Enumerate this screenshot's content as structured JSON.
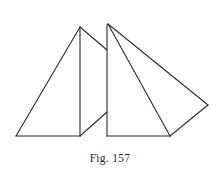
{
  "figure": {
    "caption": "Fig. 157",
    "background_color": "#ffffff",
    "stroke_color": "#2b2b2b",
    "stroke_width": 1.1,
    "caption_color": "#2b2b2b",
    "shape_description": "two overlapping triangles with shared interior segments",
    "vertices": {
      "left_apex": [
        80,
        27
      ],
      "left_base_left": [
        16,
        136
      ],
      "left_base_right": [
        80,
        136
      ],
      "left_apex_right_end": [
        107,
        50
      ],
      "mid_vertical_top": [
        80,
        27
      ],
      "mid_vertical_bottom": [
        80,
        136
      ],
      "right_vertical_top": [
        107,
        24
      ],
      "right_vertical_bottom": [
        107,
        136
      ],
      "cross_diagonal_start": [
        80,
        136
      ],
      "cross_diagonal_end": [
        107,
        112
      ],
      "right_apex": [
        108,
        24
      ],
      "right_base_left": [
        107,
        136
      ],
      "right_base_right": [
        170,
        136
      ],
      "right_far_point": [
        208,
        105
      ]
    },
    "segments": [
      {
        "name": "left-triangle-left-side",
        "from": [
          80,
          27
        ],
        "to": [
          16,
          136
        ]
      },
      {
        "name": "left-triangle-base",
        "from": [
          16,
          136
        ],
        "to": [
          80,
          136
        ]
      },
      {
        "name": "left-vertical-segment",
        "from": [
          80,
          27
        ],
        "to": [
          80,
          136
        ]
      },
      {
        "name": "left-apex-to-right-vertical",
        "from": [
          80,
          27
        ],
        "to": [
          107,
          50
        ]
      },
      {
        "name": "cross-diagonal",
        "from": [
          80,
          136
        ],
        "to": [
          107,
          112
        ]
      },
      {
        "name": "right-vertical-segment",
        "from": [
          107,
          24
        ],
        "to": [
          107,
          136
        ]
      },
      {
        "name": "right-triangle-base",
        "from": [
          107,
          136
        ],
        "to": [
          170,
          136
        ]
      },
      {
        "name": "right-apex-to-base-right",
        "from": [
          108,
          24
        ],
        "to": [
          170,
          136
        ]
      },
      {
        "name": "right-apex-to-far-point",
        "from": [
          108,
          24
        ],
        "to": [
          208,
          105
        ]
      },
      {
        "name": "far-point-to-base-right",
        "from": [
          208,
          105
        ],
        "to": [
          170,
          136
        ]
      }
    ]
  }
}
